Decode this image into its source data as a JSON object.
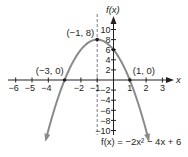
{
  "chart_data": {
    "type": "line",
    "title": "",
    "xlabel": "x",
    "ylabel": "f(x)",
    "function": "f(x) = -2x^2 - 4x + 6",
    "equation_label": "f(x) = −2x² − 4x + 6",
    "xlim": [
      -6.5,
      3.5
    ],
    "ylim": [
      -11,
      12
    ],
    "x_ticks": [
      -6,
      -5,
      -4,
      -2,
      -1,
      1,
      2,
      3
    ],
    "x_tick_labels": [
      "−6",
      "−5",
      "−4",
      "−2",
      "−1",
      "1",
      "2",
      "3"
    ],
    "y_ticks": [
      10,
      8,
      6,
      4,
      2,
      -2,
      -4,
      -6,
      -8,
      -10
    ],
    "y_tick_labels": [
      "10",
      "8",
      "6",
      "4",
      "2",
      "−2",
      "−4",
      "−6",
      "−8",
      "−10"
    ],
    "axis_of_symmetry": {
      "x": -1,
      "style": "dashed"
    },
    "points": [
      {
        "x": -3,
        "y": 0,
        "label": "(−3, 0)"
      },
      {
        "x": -1,
        "y": 8,
        "label": "(−1, 8)"
      },
      {
        "x": 1,
        "y": 0,
        "label": "(1, 0)"
      },
      {
        "x": 0,
        "y": 6,
        "label": ""
      }
    ],
    "curve_x_range": [
      -4.15,
      2.15
    ],
    "grid": false,
    "colors": {
      "curve": "#8a8a8a",
      "axes": "#231f20",
      "points": "#231f20"
    }
  }
}
